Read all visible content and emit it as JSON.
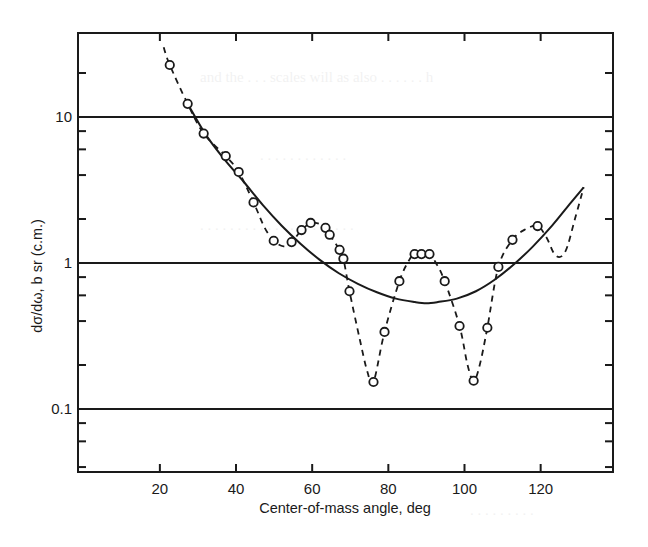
{
  "chart_data": {
    "type": "scatter",
    "title": "",
    "xlabel": "Center-of-mass angle, deg",
    "ylabel": "dσ/dω, b sr  (c.m.)",
    "xscale": "linear",
    "yscale": "log",
    "xlim": [
      -1.5,
      139
    ],
    "ylim": [
      0.037,
      37.6
    ],
    "x_ticks": [
      20,
      40,
      60,
      80,
      100,
      120
    ],
    "x_tick_labels": [
      "20",
      "40",
      "60",
      "80",
      "100",
      "120"
    ],
    "y_ticks": [
      0.1,
      1,
      10
    ],
    "y_tick_labels": [
      "0.1",
      "1",
      "10"
    ],
    "y_minor_ticks": [
      0.04,
      0.06,
      0.08,
      0.2,
      0.4,
      0.6,
      0.8,
      2,
      4,
      6,
      8,
      20
    ],
    "reference_lines_y": [
      0.1,
      1,
      10
    ],
    "grid": false,
    "legend": null,
    "series": [
      {
        "name": "measured",
        "style": "open circles joined by dashed line",
        "x": [
          22.6,
          27.3,
          31.5,
          37.3,
          40.7,
          44.6,
          49.9,
          54.6,
          57.2,
          59.6,
          63.5,
          64.6,
          67.2,
          68.2,
          69.8,
          76.1,
          79.0,
          82.9,
          86.9,
          88.7,
          90.8,
          94.8,
          98.7,
          102.4,
          106.0,
          108.9,
          112.6,
          119.2
        ],
        "y": [
          22.7,
          12.3,
          7.7,
          5.4,
          4.2,
          2.6,
          1.42,
          1.39,
          1.68,
          1.88,
          1.74,
          1.56,
          1.23,
          1.07,
          0.64,
          0.153,
          0.337,
          0.75,
          1.15,
          1.15,
          1.15,
          0.75,
          0.37,
          0.156,
          0.36,
          0.94,
          1.44,
          1.79
        ]
      },
      {
        "name": "dashed-interpolation",
        "style": "dashed line",
        "x": [
          21.0,
          22.6,
          27.3,
          31.5,
          37.3,
          40.7,
          44.6,
          47.5,
          49.9,
          52.5,
          54.6,
          57.2,
          59.6,
          62.0,
          63.5,
          64.6,
          67.2,
          68.2,
          69.8,
          72.5,
          74.5,
          76.1,
          79.0,
          82.9,
          85.5,
          86.9,
          88.7,
          90.8,
          92.5,
          94.8,
          98.7,
          100.8,
          102.4,
          104.0,
          106.0,
          108.9,
          112.6,
          116.0,
          119.2,
          121.5,
          124.0,
          126.5,
          129.0,
          131.3
        ],
        "y": [
          30.0,
          22.7,
          12.3,
          7.7,
          5.4,
          4.2,
          2.6,
          1.75,
          1.42,
          1.3,
          1.39,
          1.68,
          1.88,
          1.85,
          1.74,
          1.56,
          1.23,
          1.07,
          0.64,
          0.3,
          0.18,
          0.153,
          0.337,
          0.75,
          1.05,
          1.15,
          1.15,
          1.15,
          1.0,
          0.75,
          0.37,
          0.2,
          0.156,
          0.2,
          0.36,
          0.94,
          1.44,
          1.7,
          1.79,
          1.5,
          1.12,
          1.2,
          2.0,
          3.3
        ]
      },
      {
        "name": "fit",
        "style": "solid smooth curve",
        "x": [
          27.3,
          32,
          37,
          42,
          47,
          52,
          57,
          62,
          67,
          72,
          77,
          82,
          87,
          90,
          93,
          98,
          103,
          108,
          113,
          118,
          123,
          128,
          131.3
        ],
        "y": [
          12.3,
          7.6,
          5.1,
          3.6,
          2.5,
          1.8,
          1.35,
          1.05,
          0.85,
          0.72,
          0.63,
          0.57,
          0.54,
          0.53,
          0.54,
          0.57,
          0.64,
          0.77,
          0.98,
          1.3,
          1.8,
          2.6,
          3.3
        ]
      }
    ]
  }
}
